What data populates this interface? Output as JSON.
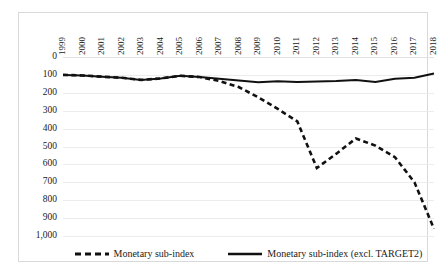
{
  "chart_data": {
    "type": "line",
    "title": "",
    "xlabel": "",
    "ylabel": "",
    "grid": true,
    "y_inverted": true,
    "ylim": [
      0,
      1000
    ],
    "y_ticks": [
      "0",
      "100",
      "200",
      "300",
      "400",
      "500",
      "600",
      "700",
      "800",
      "900",
      "1,000"
    ],
    "y_tick_values": [
      0,
      100,
      200,
      300,
      400,
      500,
      600,
      700,
      800,
      900,
      1000
    ],
    "legend_position": "bottom",
    "categories": [
      "1999",
      "2000",
      "2001",
      "2002",
      "2003",
      "2004",
      "2005",
      "2006",
      "2007",
      "2008",
      "2009",
      "2010",
      "2011",
      "2012",
      "2013",
      "2014",
      "2015",
      "2016",
      "2017",
      "2018"
    ],
    "series": [
      {
        "name": "Monetary sub-index",
        "style": "dashed",
        "color": "#111111",
        "values": [
          100,
          103,
          110,
          116,
          128,
          120,
          105,
          112,
          134,
          168,
          225,
          290,
          360,
          620,
          540,
          455,
          495,
          560,
          700,
          960
        ]
      },
      {
        "name": "Monetary sub-index (excl. TARGET2)",
        "style": "solid",
        "color": "#111111",
        "values": [
          100,
          103,
          110,
          116,
          128,
          120,
          105,
          112,
          122,
          131,
          141,
          136,
          139,
          137,
          134,
          128,
          140,
          122,
          116,
          92
        ]
      }
    ]
  },
  "legend": {
    "items": [
      {
        "label": "Monetary sub-index",
        "style": "dashed"
      },
      {
        "label": "Monetary sub-index (excl. TARGET2)",
        "style": "solid"
      }
    ]
  }
}
